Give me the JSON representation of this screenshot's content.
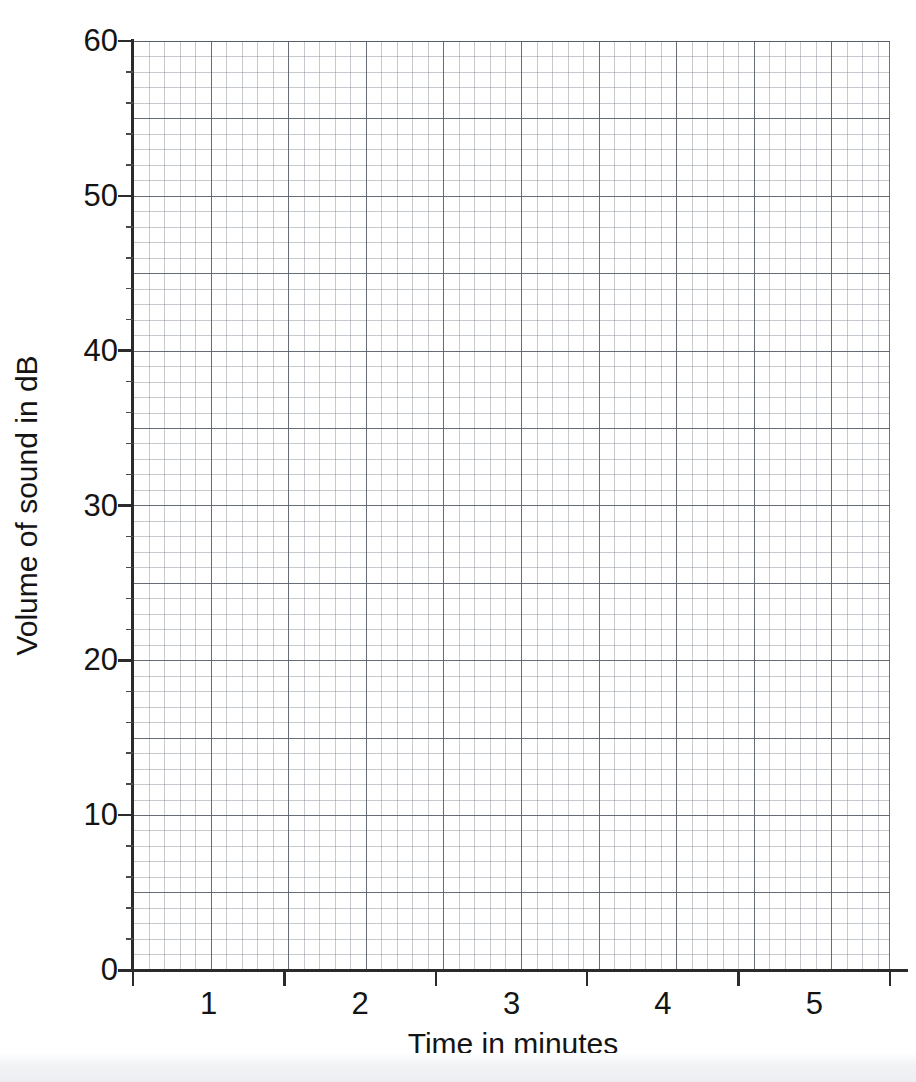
{
  "chart_data": {
    "type": "line",
    "title": "",
    "title_note": "clipped-at-top-edge",
    "xlabel": "Time in minutes",
    "ylabel": "Volume of sound in dB",
    "xlim": [
      0.5,
      5.5
    ],
    "ylim": [
      0,
      60
    ],
    "x_tick_positions": [
      0.5,
      1.5,
      2.5,
      3.5,
      4.5,
      5.5
    ],
    "x_tick_labels": [
      "1",
      "2",
      "3",
      "4",
      "5"
    ],
    "x_label_positions": [
      1,
      2,
      3,
      4,
      5
    ],
    "y_ticks": [
      0,
      10,
      20,
      30,
      40,
      50,
      60
    ],
    "y_tick_labels": [
      "0",
      "10",
      "20",
      "30",
      "40",
      "50",
      "60"
    ],
    "y_minor_tick_step": 2,
    "grid": true,
    "grid_style": "graph-paper",
    "grid_minor_step_px": 15.5,
    "grid_major_every_n_minor": 5,
    "legend": null,
    "series": [],
    "annotations": [],
    "note": "Blank graph-paper axes; no data plotted."
  },
  "axes": {
    "y_title": "Volume of sound in dB",
    "x_title": "Time in minutes",
    "y_labels": [
      "60",
      "50",
      "40",
      "30",
      "20",
      "10",
      "0"
    ],
    "x_labels": [
      "1",
      "2",
      "3",
      "4",
      "5"
    ]
  },
  "colors": {
    "background": "#ffffff",
    "axis_line": "#2b2b2b",
    "text": "#141414",
    "grid_minor": "#78808c",
    "grid_major": "#565c66",
    "scan_tint": "#eceef1"
  }
}
